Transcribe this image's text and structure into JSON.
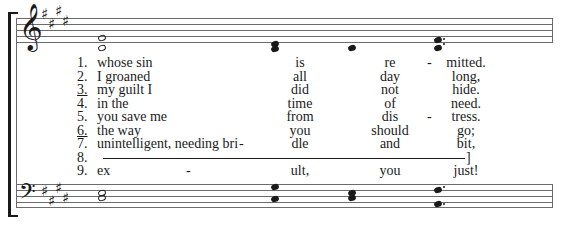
{
  "score": {
    "treble_staff": {
      "clef": "𝄞",
      "key_signature": "E major (4 sharps)",
      "sharp_glyph": "♯"
    },
    "bass_staff": {
      "clef": "𝄢",
      "key_signature": "E major (4 sharps)",
      "sharp_glyph": "♯"
    }
  },
  "verses": [
    {
      "num": "1.",
      "text": "whose sin",
      "col1": "is",
      "col2": "re",
      "hyphen2": "-",
      "col3": "mitted."
    },
    {
      "num": "2.",
      "text": "I groaned",
      "col1": "all",
      "col2": "day",
      "col3": "long,"
    },
    {
      "num": "3.",
      "text": "my guilt I",
      "col1": "did",
      "col2": "not",
      "col3": "hide.",
      "underlined": true
    },
    {
      "num": "4.",
      "text": "in the",
      "col1": "time",
      "col2": "of",
      "col3": "need."
    },
    {
      "num": "5.",
      "text": "you save me",
      "col1": "from",
      "col2": "dis",
      "hyphen2": "-",
      "col3": "tress."
    },
    {
      "num": "6.",
      "text": "the way",
      "col1": "you",
      "col2": "should",
      "col3": "go;",
      "underlined": true
    },
    {
      "num": "7.",
      "text": "unintelligent, needing bri",
      "hyphen1": "-",
      "col1": "dle",
      "col2": "and",
      "col3": "bit,"
    },
    {
      "num": "8.",
      "text": "",
      "col3": "]"
    },
    {
      "num": "9.",
      "text": "ex",
      "hyphen1": "-",
      "col1": "ult,",
      "col2": "you",
      "col3": "just!"
    }
  ]
}
